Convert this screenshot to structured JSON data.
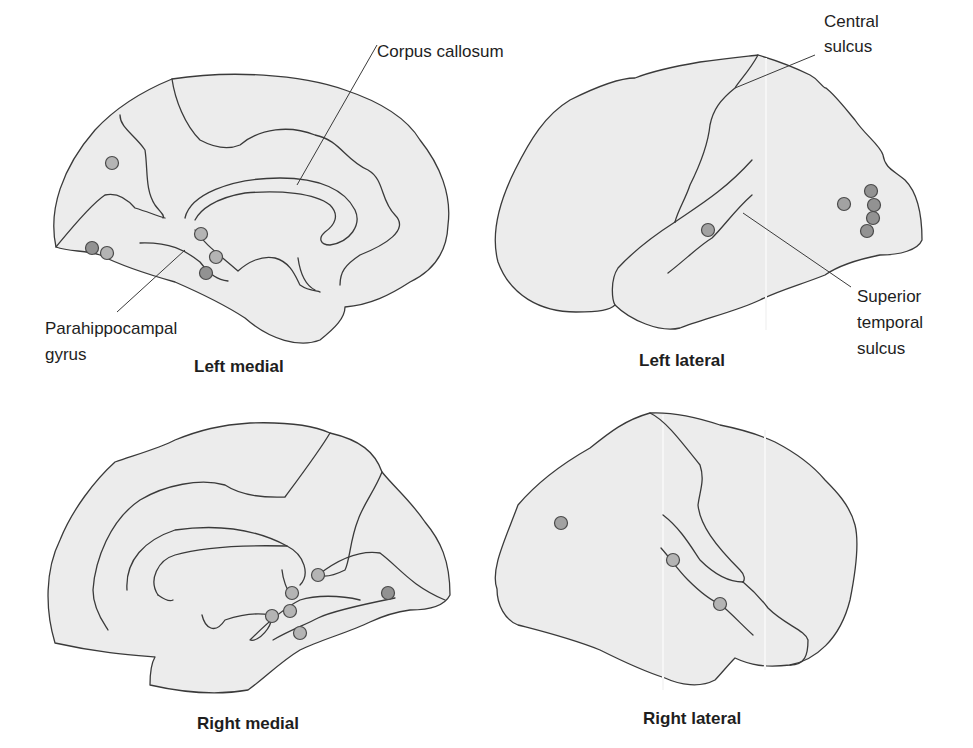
{
  "figure": {
    "panels": [
      {
        "id": "left-medial",
        "title": "Left medial",
        "annotations": [
          "Corpus callosum",
          "Parahippocampal gyrus"
        ],
        "activation_dots": [
          {
            "x": 112,
            "y": 163,
            "shade": "light"
          },
          {
            "x": 92,
            "y": 248,
            "shade": "dark"
          },
          {
            "x": 107,
            "y": 253,
            "shade": "light"
          },
          {
            "x": 201,
            "y": 234,
            "shade": "light"
          },
          {
            "x": 216,
            "y": 257,
            "shade": "light"
          },
          {
            "x": 206,
            "y": 273,
            "shade": "dark"
          }
        ]
      },
      {
        "id": "left-lateral",
        "title": "Left lateral",
        "annotations": [
          "Central sulcus",
          "Superior temporal sulcus"
        ],
        "activation_dots": [
          {
            "x": 708,
            "y": 230,
            "shade": "mid"
          },
          {
            "x": 844,
            "y": 204,
            "shade": "mid"
          },
          {
            "x": 871,
            "y": 191,
            "shade": "dark"
          },
          {
            "x": 874,
            "y": 205,
            "shade": "dark"
          },
          {
            "x": 873,
            "y": 218,
            "shade": "dark"
          },
          {
            "x": 867,
            "y": 231,
            "shade": "dark"
          }
        ]
      },
      {
        "id": "right-medial",
        "title": "Right medial",
        "annotations": [],
        "activation_dots": [
          {
            "x": 318,
            "y": 575,
            "shade": "light"
          },
          {
            "x": 292,
            "y": 593,
            "shade": "light"
          },
          {
            "x": 290,
            "y": 611,
            "shade": "light"
          },
          {
            "x": 272,
            "y": 616,
            "shade": "light"
          },
          {
            "x": 300,
            "y": 633,
            "shade": "light"
          },
          {
            "x": 388,
            "y": 593,
            "shade": "dark"
          }
        ]
      },
      {
        "id": "right-lateral",
        "title": "Right lateral",
        "annotations": [],
        "activation_dots": [
          {
            "x": 561,
            "y": 523,
            "shade": "mid"
          },
          {
            "x": 673,
            "y": 560,
            "shade": "light"
          },
          {
            "x": 720,
            "y": 604,
            "shade": "light"
          }
        ]
      }
    ],
    "labels": {
      "left_medial_title": "Left medial",
      "left_lateral_title": "Left lateral",
      "right_medial_title": "Right medial",
      "right_lateral_title": "Right lateral",
      "corpus_callosum": "Corpus callosum",
      "parahippocampal_line1": "Parahippocampal",
      "parahippocampal_line2": "gyrus",
      "central_line1": "Central",
      "central_line2": "sulcus",
      "superior_line1": "Superior",
      "superior_line2": "temporal",
      "superior_line3": "sulcus"
    },
    "colors": {
      "brain_fill": "#ececec",
      "outline": "#3a3a3a",
      "dot_light": "#b4b4b4",
      "dot_mid": "#a2a2a2",
      "dot_dark": "#929292"
    }
  }
}
